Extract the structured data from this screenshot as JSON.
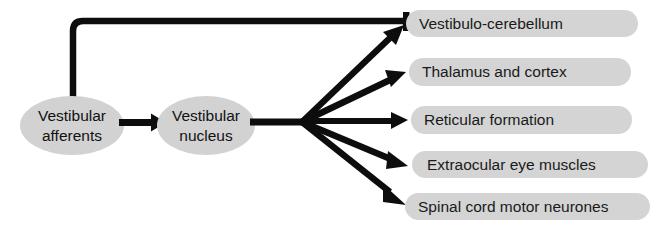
{
  "diagram": {
    "background_color": "#ffffff",
    "stroke_color": "#0d0d0d",
    "node_fill_color": "#d2d2d2",
    "pill_fill_color": "#d4d4d4",
    "text_color": "#111111",
    "nodes": [
      {
        "id": "vestibular-afferents",
        "line1": "Vestibular",
        "line2": "afferents",
        "shape": "ellipse"
      },
      {
        "id": "vestibular-nucleus",
        "line1": "Vestibular",
        "line2": "nucleus",
        "shape": "ellipse"
      }
    ],
    "targets": [
      {
        "id": "vestibulo-cerebellum",
        "label": "Vestibulo-cerebellum"
      },
      {
        "id": "thalamus-and-cortex",
        "label": "Thalamus and cortex"
      },
      {
        "id": "reticular-formation",
        "label": "Reticular formation"
      },
      {
        "id": "extraocular-eye-muscles",
        "label": "Extraocular eye muscles"
      },
      {
        "id": "spinal-cord-motor-neurones",
        "label": "Spinal cord motor neurones"
      }
    ],
    "connectors": [
      {
        "id": "afferents-to-nucleus",
        "terminal": "arrowhead"
      },
      {
        "id": "nucleus-to-hub",
        "terminal": "none"
      },
      {
        "id": "hub-to-vestibulo-cerebellum",
        "terminal": "arrowhead"
      },
      {
        "id": "hub-to-thalamus-and-cortex",
        "terminal": "arrowhead"
      },
      {
        "id": "hub-to-reticular-formation",
        "terminal": "arrowhead"
      },
      {
        "id": "hub-to-extraocular-eye-muscles",
        "terminal": "arrowhead"
      },
      {
        "id": "hub-to-spinal-cord-motor-neurones",
        "terminal": "arrowhead"
      },
      {
        "id": "cerebellum-feedback-to-afferents",
        "terminal": "tee-bar"
      }
    ]
  }
}
